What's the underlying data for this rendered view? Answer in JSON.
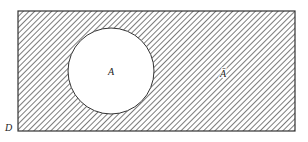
{
  "diagram": {
    "type": "venn",
    "universe_label": "D",
    "set_label": "A",
    "complement_label": "Ā",
    "shaded_region": "complement",
    "colors": {
      "stroke": "#333333",
      "hatch": "#555555",
      "background": "#ffffff"
    }
  }
}
